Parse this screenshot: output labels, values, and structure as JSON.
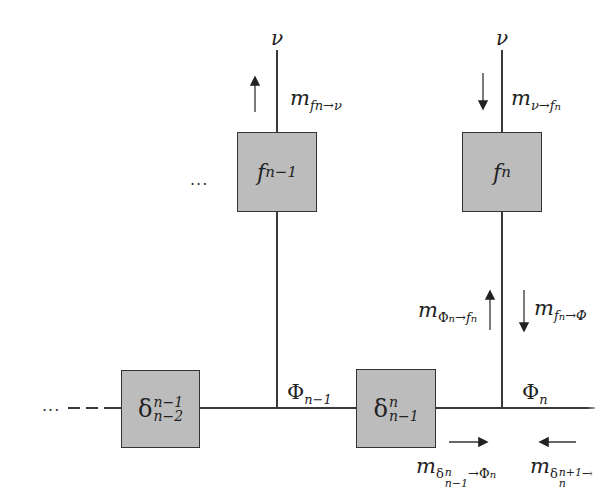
{
  "diagram": {
    "type": "factor-graph message passing",
    "nodes": {
      "f_prev": {
        "label": "f",
        "sub": "n−1"
      },
      "f_curr": {
        "label": "f",
        "sub": "n"
      },
      "delta_prev": {
        "label": "δ",
        "sup": "n−1",
        "sub": "n−2"
      },
      "delta_curr": {
        "label": "δ",
        "sup": "n",
        "sub": "n−1"
      }
    },
    "variables": {
      "v_left": "ν",
      "v_right": "ν",
      "phi_prev": {
        "label": "Φ",
        "sub": "n−1"
      },
      "phi_curr": {
        "label": "Φ",
        "sub": "n"
      }
    },
    "messages": {
      "m_f_to_v": {
        "m": "m",
        "sub": "fn→ν",
        "arrow": "up"
      },
      "m_v_to_f": {
        "m": "m",
        "sub": "ν→f",
        "subsub": "n",
        "arrow": "down"
      },
      "m_phi_to_f": {
        "m": "m",
        "sub_a": "Φ",
        "sub_a_n": "n",
        "sub_b": "→f",
        "sub_b_n": "n",
        "arrow": "up"
      },
      "m_f_to_phi": {
        "m": "m",
        "sub_a": "f",
        "sub_a_n": "n",
        "sub_b": "→Φ",
        "arrow": "down"
      },
      "m_delta_to_phi": {
        "m": "m",
        "sub_a": "δ",
        "sup": "n",
        "sub_a_n": "n−1",
        "sub_b": "→Φ",
        "sub_b_n": "n",
        "arrow": "right"
      },
      "m_delta_next": {
        "m": "m",
        "sub_a": "δ",
        "sup": "n+1",
        "sub_a_n": "n",
        "sub_b": "→",
        "arrow": "left"
      }
    },
    "ellipsis_top": "...",
    "ellipsis_left": "..."
  }
}
